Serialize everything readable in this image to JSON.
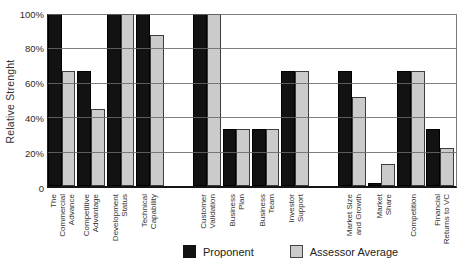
{
  "chart_data": {
    "type": "bar",
    "title": "",
    "ylabel": "Relative Strenght",
    "ylim": [
      0,
      100
    ],
    "ytick_labels": [
      "100%",
      "80%",
      "60%",
      "40%",
      "20%",
      "0"
    ],
    "grid": true,
    "gridline_interval_percent": 20,
    "legend_position": "bottom",
    "categories": [
      "The Commercial\nAdvance",
      "Competitive\nAdvantage",
      "Development\nStatus",
      "Technical\nCapability",
      "Customer\nValidation",
      "Business\nPlan",
      "Business\nTeam",
      "Investor\nSupport",
      "Market Size\nand Growth",
      "Market\nShare",
      "Competition",
      "Financial\nReturns to VC"
    ],
    "gap_after_category_indices": [
      3,
      7
    ],
    "series": [
      {
        "name": "Proponent",
        "color": "#121212",
        "values": [
          100,
          67,
          100,
          100,
          100,
          33,
          33,
          67,
          67,
          2,
          67,
          33
        ]
      },
      {
        "name": "Assessor Average",
        "color": "#cbcbcb",
        "values": [
          67,
          45,
          100,
          88,
          100,
          33,
          33,
          67,
          52,
          13,
          67,
          22
        ]
      }
    ],
    "colors": {
      "gridline": "#696969",
      "axis": "#151515",
      "text": "#2b2b2b",
      "background": "#ffffff"
    }
  }
}
